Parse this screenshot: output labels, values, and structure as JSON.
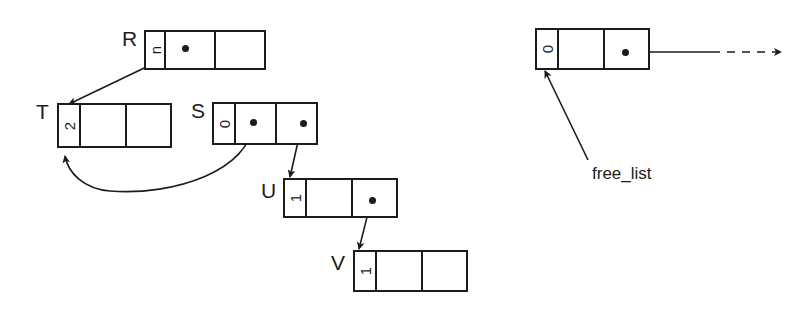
{
  "diagram": {
    "ink_color": "#1c1c1c",
    "background": "#ffffff",
    "nodes": [
      {
        "id": "R",
        "label": "R",
        "tag_value": "n",
        "x": 144,
        "y": 30,
        "width": 122,
        "height": 40,
        "tag_width": 20,
        "label_x": 122,
        "label_y": 28,
        "pointer_dot": {
          "x": 185,
          "y": 48
        }
      },
      {
        "id": "T",
        "label": "T",
        "tag_value": "2",
        "x": 57,
        "y": 103,
        "width": 115,
        "height": 45,
        "tag_width": 22,
        "label_x": 36,
        "label_y": 101,
        "pointer_dot": null
      },
      {
        "id": "S",
        "label": "S",
        "tag_value": "0",
        "x": 212,
        "y": 102,
        "width": 106,
        "height": 43,
        "tag_width": 22,
        "label_x": 191,
        "label_y": 100,
        "pointer_dot": {
          "x": 253,
          "y": 122
        },
        "pointer_dot2": {
          "x": 303,
          "y": 123
        }
      },
      {
        "id": "U",
        "label": "U",
        "tag_value": "1",
        "x": 283,
        "y": 178,
        "width": 115,
        "height": 40,
        "tag_width": 22,
        "label_x": 261,
        "label_y": 180,
        "pointer_dot": {
          "x": 372,
          "y": 200
        }
      },
      {
        "id": "V",
        "label": "V",
        "tag_value": "1",
        "x": 353,
        "y": 250,
        "width": 115,
        "height": 42,
        "tag_width": 22,
        "label_x": 331,
        "label_y": 252,
        "pointer_dot": null
      },
      {
        "id": "free",
        "label": "",
        "tag_value": "0",
        "x": 535,
        "y": 28,
        "width": 115,
        "height": 42,
        "tag_width": 22,
        "label_x": 0,
        "label_y": 0,
        "field_label": "next",
        "field_label_x": 604,
        "field_label_y": 33,
        "pointer_dot": {
          "x": 625,
          "y": 52
        }
      }
    ],
    "free_list_label": {
      "text": "free_list",
      "x": 592,
      "y": 173
    },
    "edges": [
      {
        "name": "r-to-t",
        "from": "R",
        "to": "T",
        "style": "solid"
      },
      {
        "name": "s-to-t",
        "from": "S",
        "to": "T",
        "style": "curved"
      },
      {
        "name": "s-to-u",
        "from": "S",
        "to": "U",
        "style": "solid"
      },
      {
        "name": "u-to-v",
        "from": "U",
        "to": "V",
        "style": "solid"
      },
      {
        "name": "free-next-out",
        "from": "free",
        "to": "offscreen",
        "style": "dashed"
      },
      {
        "name": "free-list-leader",
        "from": "free_list_label",
        "to": "free",
        "style": "solid"
      }
    ]
  }
}
